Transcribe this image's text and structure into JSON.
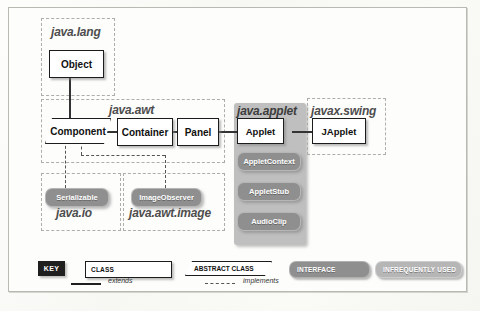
{
  "diagram": {
    "packages": [
      {
        "id": "java-lang",
        "label": "java.lang"
      },
      {
        "id": "java-awt",
        "label": "java.awt"
      },
      {
        "id": "java-applet",
        "label": "java.applet"
      },
      {
        "id": "javax-swing",
        "label": "javax.swing"
      },
      {
        "id": "java-io",
        "label": "java.io"
      },
      {
        "id": "java-awt-image",
        "label": "java.awt.image"
      }
    ],
    "classes": [
      {
        "id": "object",
        "label": "Object",
        "kind": "class"
      },
      {
        "id": "component",
        "label": "Component",
        "kind": "abstract-class"
      },
      {
        "id": "container",
        "label": "Container",
        "kind": "class"
      },
      {
        "id": "panel",
        "label": "Panel",
        "kind": "class"
      },
      {
        "id": "applet",
        "label": "Applet",
        "kind": "class"
      },
      {
        "id": "japplet",
        "label": "JApplet",
        "kind": "class"
      }
    ],
    "interfaces": [
      {
        "id": "appletcontext",
        "label": "AppletContext",
        "style": "dark"
      },
      {
        "id": "appletstub",
        "label": "AppletStub",
        "style": "dark"
      },
      {
        "id": "audioclip",
        "label": "AudioClip",
        "style": "dark"
      },
      {
        "id": "serializable",
        "label": "Serializable",
        "style": "dark"
      },
      {
        "id": "imageobserver",
        "label": "ImageObserver",
        "style": "dark"
      }
    ],
    "relationships": [
      {
        "from": "object",
        "to": "component",
        "type": "extends"
      },
      {
        "from": "component",
        "to": "container",
        "type": "extends"
      },
      {
        "from": "container",
        "to": "panel",
        "type": "extends"
      },
      {
        "from": "panel",
        "to": "applet",
        "type": "extends"
      },
      {
        "from": "applet",
        "to": "japplet",
        "type": "extends"
      },
      {
        "from": "component",
        "to": "serializable",
        "type": "implements"
      },
      {
        "from": "component",
        "to": "imageobserver",
        "type": "implements"
      }
    ]
  },
  "legend": {
    "key_label": "KEY",
    "class_label": "CLASS",
    "abstract_class_label": "ABSTRACT CLASS",
    "interface_label": "INTERFACE",
    "infrequently_used_label": "INFREQUENTLY USED",
    "extends_label": "extends",
    "implements_label": "implements"
  },
  "colors": {
    "interface_dark": "#8f8f8f",
    "interface_light": "#b6b6b6",
    "applet_package_bg": "#bfbfbf",
    "key_box_bg": "#1f1f1f",
    "line": "#333333"
  }
}
